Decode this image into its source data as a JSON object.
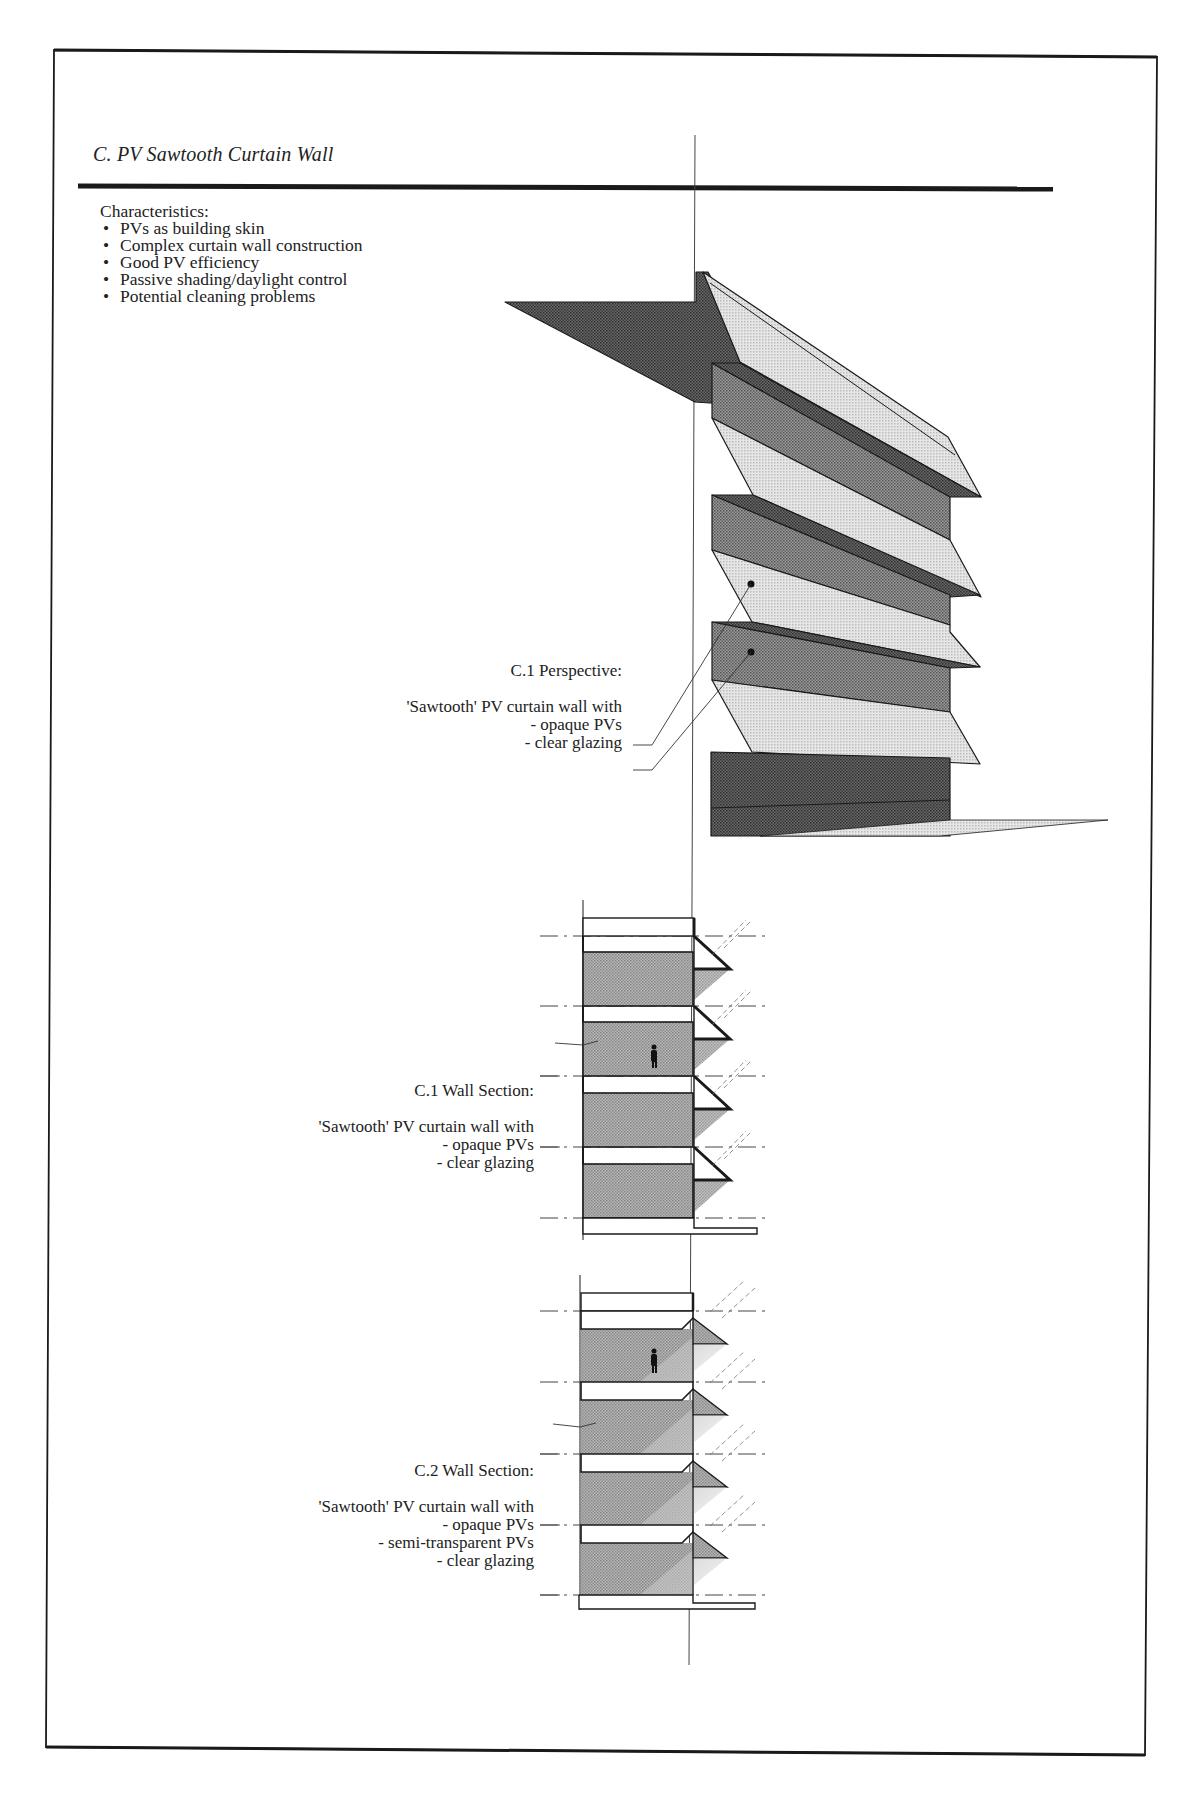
{
  "page": {
    "section_title": "C.  PV Sawtooth Curtain Wall",
    "characteristics": {
      "heading": "Characteristics:",
      "items": [
        "PVs as building skin",
        "Complex curtain wall construction",
        "Good PV efficiency",
        "Passive shading/daylight control",
        "Potential cleaning problems"
      ]
    }
  },
  "figures": {
    "perspective": {
      "title": "C.1  Perspective:",
      "description": "'Sawtooth' PV curtain wall with",
      "items": [
        "- opaque PVs",
        "- clear glazing"
      ]
    },
    "wall_section_1": {
      "title": "C.1  Wall Section:",
      "description": "'Sawtooth' PV curtain wall with",
      "items": [
        "- opaque PVs",
        "- clear glazing"
      ]
    },
    "wall_section_2": {
      "title": "C.2  Wall Section:",
      "description": "'Sawtooth' PV curtain wall with",
      "items": [
        "- opaque PVs",
        "- semi-transparent PVs",
        "- clear glazing"
      ]
    }
  },
  "colors": {
    "ink": "#1a1a1a",
    "dark_screen": "#555555",
    "mid_screen": "#7a7a7a",
    "light_screen": "#d2d2d2",
    "paper": "#ffffff"
  }
}
